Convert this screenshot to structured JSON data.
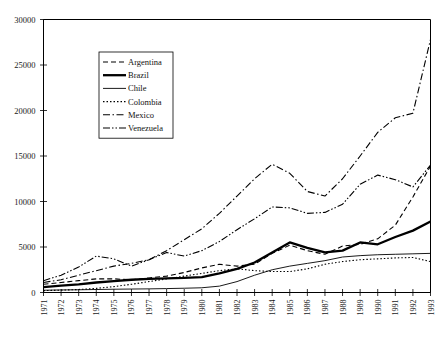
{
  "chart_data": {
    "type": "line",
    "title": "",
    "xlabel": "",
    "ylabel": "",
    "ylim": [
      0,
      30000
    ],
    "ytick_values": [
      0,
      5000,
      10000,
      15000,
      20000,
      25000,
      30000
    ],
    "ytick_labels": [
      "0",
      "5000",
      "10000",
      "15000",
      "20000",
      "25000",
      "30000"
    ],
    "grid": false,
    "legend_position": "upper-left-inside",
    "x": [
      1971,
      1972,
      1973,
      1974,
      1975,
      1976,
      1977,
      1978,
      1979,
      1980,
      1981,
      1982,
      1983,
      1984,
      1985,
      1986,
      1987,
      1988,
      1989,
      1990,
      1991,
      1992,
      1993
    ],
    "xtick_labels": [
      "1971",
      "1972",
      "1973",
      "1974",
      "1975",
      "1976",
      "1977",
      "1978",
      "1979",
      "1980",
      "1981",
      "1982",
      "1983",
      "1984",
      "1985",
      "1986",
      "1987",
      "1988",
      "1989",
      "1990",
      "1991",
      "1992",
      "1993"
    ],
    "series": [
      {
        "name": "Argentina",
        "style": "dashed",
        "width": 1.1,
        "dash": "5,3",
        "values": [
          900,
          1100,
          1300,
          1500,
          1500,
          1400,
          1600,
          1800,
          2200,
          2700,
          3100,
          2900,
          3100,
          4300,
          5200,
          4600,
          4200,
          5100,
          5300,
          5900,
          7400,
          10500,
          13900
        ]
      },
      {
        "name": "Brazil",
        "style": "thick-solid",
        "width": 2.3,
        "dash": "none",
        "values": [
          600,
          750,
          900,
          1100,
          1250,
          1400,
          1500,
          1550,
          1600,
          1700,
          2100,
          2600,
          3300,
          4400,
          5500,
          4900,
          4400,
          4600,
          5500,
          5300,
          6100,
          6800,
          7800
        ]
      },
      {
        "name": "Chile",
        "style": "thin-solid",
        "width": 0.9,
        "dash": "none",
        "values": [
          250,
          280,
          300,
          330,
          360,
          380,
          400,
          430,
          470,
          520,
          700,
          1200,
          1900,
          2500,
          2900,
          3200,
          3500,
          3900,
          4050,
          4150,
          4200,
          4250,
          4300
        ]
      },
      {
        "name": "Colombia",
        "style": "dotted",
        "width": 1.1,
        "dash": "1.5,2",
        "values": [
          200,
          260,
          330,
          450,
          650,
          900,
          1200,
          1500,
          1800,
          2100,
          2400,
          2600,
          2400,
          2300,
          2300,
          2600,
          3100,
          3400,
          3600,
          3700,
          3800,
          3850,
          3400
        ]
      },
      {
        "name": "Mexico",
        "style": "dash-dot",
        "width": 1.1,
        "dash": "7,2.5,1.5,2.5",
        "values": [
          1100,
          1400,
          1900,
          2400,
          2900,
          3200,
          3600,
          4600,
          5800,
          7000,
          8700,
          10600,
          12500,
          14100,
          13100,
          11100,
          10600,
          12500,
          15000,
          17600,
          19200,
          19700,
          27800
        ]
      },
      {
        "name": "Venezuela",
        "style": "dash-dot-dot",
        "width": 1.1,
        "dash": "7,2,1.5,2,1.5,2",
        "values": [
          1300,
          1900,
          2800,
          4000,
          3700,
          2900,
          3600,
          4400,
          4000,
          4600,
          5600,
          6900,
          8100,
          9400,
          9300,
          8700,
          8800,
          9700,
          11900,
          12900,
          12400,
          11600,
          14000
        ]
      }
    ]
  },
  "legend": {
    "entries": [
      {
        "label": "Argentina"
      },
      {
        "label": "Brazil"
      },
      {
        "label": "Chile"
      },
      {
        "label": "Colombia"
      },
      {
        "label": "Mexico"
      },
      {
        "label": "Venezuela"
      }
    ]
  },
  "colors": {
    "axis": "#000000",
    "series": "#000000",
    "background": "#ffffff"
  }
}
